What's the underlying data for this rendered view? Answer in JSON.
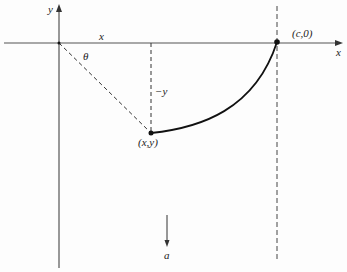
{
  "diagram": {
    "type": "geometry-figure",
    "axes": {
      "y_label": "y",
      "x_label_top": "x",
      "x_axis_label": "x"
    },
    "labels": {
      "theta": "θ",
      "minus_y": "−y",
      "point_xy": "(x,y)",
      "point_c0": "(c,0)",
      "acceleration": "a"
    },
    "points": [
      {
        "name": "origin",
        "px": [
          59,
          43
        ]
      },
      {
        "name": "(x,y)",
        "px": [
          151,
          133
        ]
      },
      {
        "name": "(c,0)",
        "px": [
          277,
          42
        ]
      }
    ],
    "colors": {
      "ink": "#222222",
      "axis": "#555555",
      "background": "#fdfdfd"
    }
  }
}
